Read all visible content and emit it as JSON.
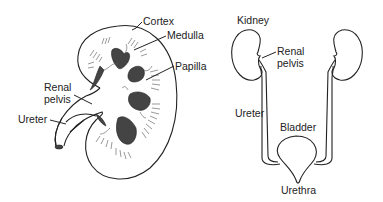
{
  "diagram": {
    "type": "anatomical illustration",
    "left_panel": {
      "subject": "Kidney cross-section",
      "labels": {
        "cortex": "Cortex",
        "medulla": "Medulla",
        "papilla": "Papilla",
        "renal_pelvis_line1": "Renal",
        "renal_pelvis_line2": "pelvis",
        "ureter": "Ureter"
      }
    },
    "right_panel": {
      "subject": "Urinary system",
      "labels": {
        "kidney": "Kidney",
        "renal_pelvis_line1": "Renal",
        "renal_pelvis_line2": "pelvis",
        "ureter": "Ureter",
        "bladder": "Bladder",
        "urethra": "Urethra"
      }
    },
    "colors": {
      "line": "#222222",
      "fill_dark": "#444444",
      "background": "#ffffff"
    }
  }
}
